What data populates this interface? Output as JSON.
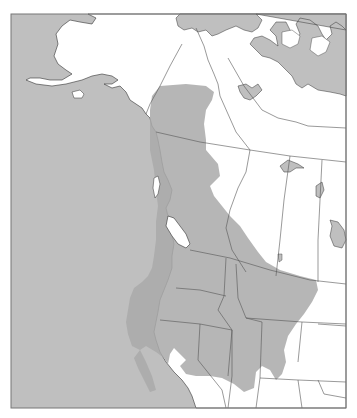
{
  "map": {
    "type": "species-range-map",
    "region": "Western North America",
    "colors": {
      "background": "#ffffff",
      "ocean": "#bfbfbf",
      "land": "#ffffff",
      "range": "#b3b3b3",
      "lakes": "#bfbfbf",
      "borders": "#555555",
      "frame": "#777777"
    },
    "frame": {
      "x": 11,
      "y": 14,
      "width": 335,
      "height": 394
    },
    "layers": [
      "ocean",
      "land",
      "lakes",
      "range",
      "political-borders",
      "frame"
    ],
    "labels": []
  }
}
